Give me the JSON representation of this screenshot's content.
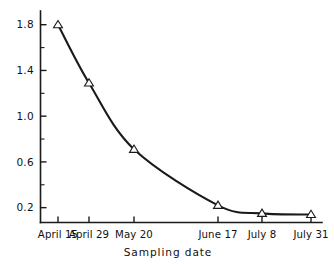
{
  "chart_data": {
    "type": "line",
    "title": "",
    "subtitle": "",
    "xlabel": "Sampling  date",
    "ylabel": "",
    "categories": [
      "April 15",
      "April 29",
      "May 20",
      "June 17",
      "July 8",
      "July 31"
    ],
    "x": [
      0,
      14,
      35,
      63,
      84,
      107
    ],
    "values": [
      1.8,
      1.29,
      0.71,
      0.22,
      0.15,
      0.14
    ],
    "series": [
      {
        "name": "",
        "values": [
          1.8,
          1.29,
          0.71,
          0.22,
          0.15,
          0.14
        ]
      }
    ],
    "marker": "open-triangle",
    "line_style": "solid-smooth",
    "xlim": [
      -4,
      115
    ],
    "ylim": [
      0.07,
      1.92
    ],
    "yticks_major": [
      0.2,
      0.6,
      1.0,
      1.4,
      1.8
    ],
    "yticks_major_labels": [
      "0.2",
      "0.6",
      "1.0",
      "1.4",
      "1.8"
    ],
    "yticks_minor": [
      0.4,
      0.8,
      1.2,
      1.6
    ],
    "xtick_labels": [
      "April 15",
      "April 29",
      "May 20",
      "June 17",
      "July 8",
      "July 31"
    ],
    "grid": false,
    "legend": "none",
    "annotations": [],
    "line_color": "#1a1a1a",
    "marker_fill": "#ffffff",
    "marker_edge": "#1a1a1a",
    "background": "#ffffff"
  },
  "axis": {
    "x_title": "Sampling  date"
  }
}
